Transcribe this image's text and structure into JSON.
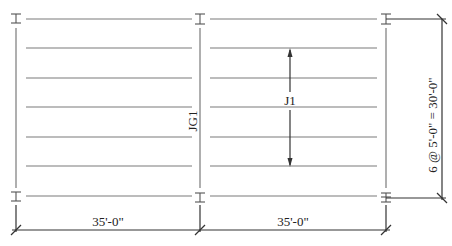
{
  "diagram": {
    "type": "framing-plan",
    "labels": {
      "girder": "JG1",
      "joist": "J1",
      "bay_width_left": "35'-0\"",
      "bay_width_right": "35'-0\"",
      "joist_spacing": "6 @ 5'-0\" = 30'-0\""
    },
    "colors": {
      "member_line": "#7a7a7a",
      "dimension_line": "#333333",
      "text": "#222222"
    },
    "geometry": {
      "columns_x": [
        16,
        200,
        385
      ],
      "joist_lines_y": [
        19,
        48,
        78,
        107,
        137,
        166,
        196
      ],
      "dimension_bottom_y": 230,
      "dimension_right_x": 442
    }
  }
}
